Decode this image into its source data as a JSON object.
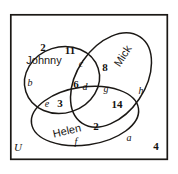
{
  "diagram": {
    "universe_label": "U",
    "sets": [
      {
        "name": "Johnny",
        "x": 44,
        "y": 60,
        "rotate": 0
      },
      {
        "name": "Mick",
        "x": 123,
        "y": 56,
        "rotate": -57
      },
      {
        "name": "Helen",
        "x": 67,
        "y": 131,
        "rotate": -13
      }
    ],
    "counts": [
      {
        "value": "2",
        "x": 43,
        "y": 47,
        "region": "johnny-only"
      },
      {
        "value": "11",
        "x": 70,
        "y": 50,
        "region": "johnny-mick"
      },
      {
        "value": "8",
        "x": 105,
        "y": 67,
        "region": "mick-only"
      },
      {
        "value": "6",
        "x": 76,
        "y": 84,
        "region": "johnny-mick-helen"
      },
      {
        "value": "3",
        "x": 60,
        "y": 103,
        "region": "johnny-helen"
      },
      {
        "value": "14",
        "x": 117,
        "y": 104,
        "region": "mick-helen"
      },
      {
        "value": "2",
        "x": 96,
        "y": 126,
        "region": "helen-only"
      },
      {
        "value": "4",
        "x": 156,
        "y": 146,
        "region": "outside-all"
      }
    ],
    "regions": [
      {
        "letter": "c",
        "x": 81,
        "y": 64
      },
      {
        "letter": "b",
        "x": 30,
        "y": 83
      },
      {
        "letter": "d",
        "x": 85,
        "y": 87
      },
      {
        "letter": "g",
        "x": 106,
        "y": 89
      },
      {
        "letter": "h",
        "x": 141,
        "y": 91
      },
      {
        "letter": "e",
        "x": 47,
        "y": 104
      },
      {
        "letter": "f",
        "x": 76,
        "y": 142
      },
      {
        "letter": "a",
        "x": 129,
        "y": 138
      }
    ],
    "universe": {
      "x": 18,
      "y": 147
    },
    "colors": {
      "stroke": "#1b1815",
      "background": "#ffffff",
      "text": "#13110f"
    },
    "geometry": {
      "frame": {
        "x": 10,
        "y": 14,
        "width": 158,
        "height": 146
      },
      "ellipses": [
        {
          "name": "Johnny",
          "cx": 62,
          "cy": 80,
          "rx": 38,
          "ry": 33,
          "rotate": -18
        },
        {
          "name": "Mick",
          "cx": 111,
          "cy": 80,
          "rx": 52,
          "ry": 34,
          "rotate": -56
        },
        {
          "name": "Helen",
          "cx": 85,
          "cy": 116,
          "rx": 54,
          "ry": 29,
          "rotate": -8
        }
      ]
    }
  }
}
